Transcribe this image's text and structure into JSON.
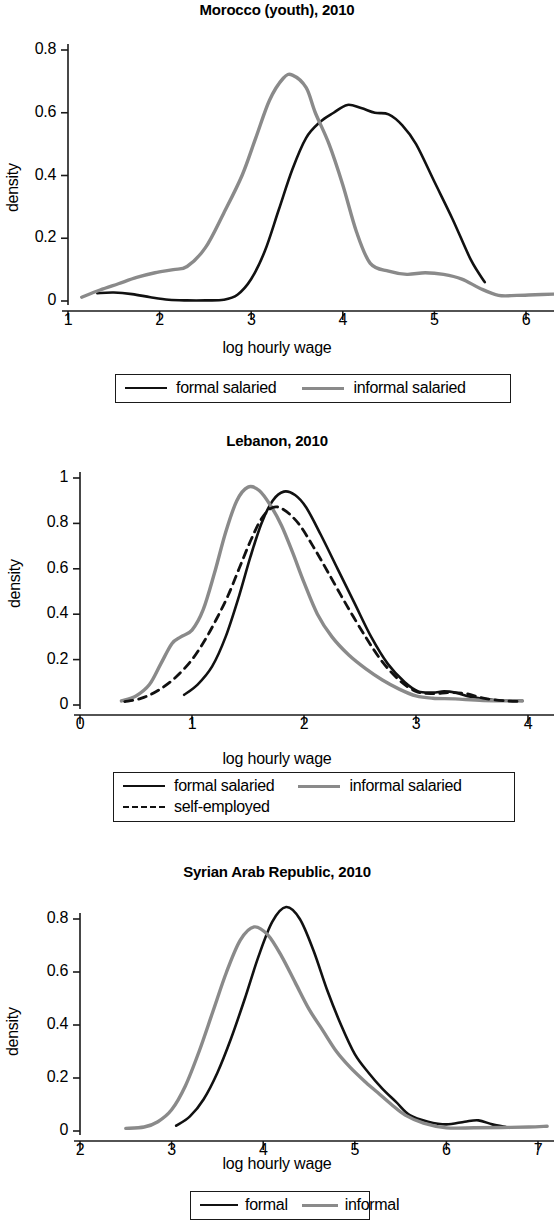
{
  "figure": {
    "axis_label_x": "log hourly wage",
    "axis_label_y": "density"
  },
  "panels": [
    {
      "id": "morocco",
      "title": "Morocco (youth), 2010",
      "xlabel": "log hourly wage",
      "ylabel": "density",
      "xticks": [
        "1",
        "2",
        "3",
        "4",
        "5",
        "6"
      ],
      "yticks": [
        "0",
        "0.2",
        "0.4",
        "0.6",
        "0.8"
      ],
      "legend": [
        {
          "label": "formal salaried",
          "style": "solid-black"
        },
        {
          "label": "informal salaried",
          "style": "solid-gray"
        }
      ]
    },
    {
      "id": "lebanon",
      "title": "Lebanon, 2010",
      "xlabel": "log hourly wage",
      "ylabel": "density",
      "xticks": [
        "0",
        "1",
        "2",
        "3",
        "4"
      ],
      "yticks": [
        "0",
        "0.2",
        "0.4",
        "0.6",
        "0.8",
        "1"
      ],
      "legend": [
        {
          "label": "formal salaried",
          "style": "solid-black"
        },
        {
          "label": "informal salaried",
          "style": "solid-gray"
        },
        {
          "label": "self-employed",
          "style": "dashed-black"
        }
      ]
    },
    {
      "id": "syria",
      "title": "Syrian Arab Republic, 2010",
      "xlabel": "log hourly wage",
      "ylabel": "density",
      "xticks": [
        "2",
        "3",
        "4",
        "5",
        "6",
        "7"
      ],
      "yticks": [
        "0",
        "0.2",
        "0.4",
        "0.6",
        "0.8"
      ],
      "legend": [
        {
          "label": "formal",
          "style": "solid-black"
        },
        {
          "label": "informal",
          "style": "solid-gray"
        }
      ]
    }
  ],
  "colors": {
    "formal": "#111111",
    "informal": "#8a8a8a",
    "self_employed": "#111111",
    "axis": "#1a1a1a",
    "background": "#ffffff"
  },
  "chart_data": [
    {
      "type": "line",
      "title": "Morocco (youth), 2010",
      "xlabel": "log hourly wage",
      "ylabel": "density",
      "xlim": [
        1.0,
        6.35
      ],
      "ylim": [
        0,
        0.8
      ],
      "xticks": [
        1,
        2,
        3,
        4,
        5,
        6
      ],
      "yticks": [
        0,
        0.2,
        0.4,
        0.6,
        0.8
      ],
      "grid": false,
      "legend_position": "below-axis",
      "series": [
        {
          "name": "formal salaried",
          "color": "#111111",
          "dash": "solid",
          "x": [
            1.32,
            1.5,
            1.7,
            1.9,
            2.1,
            2.3,
            2.5,
            2.7,
            2.85,
            3.0,
            3.15,
            3.3,
            3.45,
            3.6,
            3.75,
            3.9,
            4.05,
            4.2,
            4.35,
            4.5,
            4.65,
            4.8,
            5.0,
            5.2,
            5.4,
            5.55
          ],
          "y": [
            0.025,
            0.027,
            0.022,
            0.012,
            0.004,
            0.002,
            0.002,
            0.004,
            0.02,
            0.07,
            0.16,
            0.29,
            0.42,
            0.52,
            0.57,
            0.6,
            0.625,
            0.615,
            0.6,
            0.595,
            0.56,
            0.5,
            0.38,
            0.26,
            0.13,
            0.06
          ]
        },
        {
          "name": "informal salaried",
          "color": "#8a8a8a",
          "dash": "solid",
          "x": [
            1.15,
            1.35,
            1.55,
            1.75,
            1.95,
            2.15,
            2.3,
            2.5,
            2.7,
            2.9,
            3.05,
            3.2,
            3.35,
            3.45,
            3.6,
            3.7,
            3.85,
            4.0,
            4.15,
            4.3,
            4.5,
            4.7,
            4.9,
            5.1,
            5.3,
            5.5,
            5.7,
            5.9,
            6.1,
            6.3
          ],
          "y": [
            0.012,
            0.035,
            0.055,
            0.075,
            0.09,
            0.1,
            0.11,
            0.17,
            0.28,
            0.4,
            0.52,
            0.64,
            0.71,
            0.72,
            0.68,
            0.6,
            0.5,
            0.37,
            0.22,
            0.12,
            0.095,
            0.085,
            0.09,
            0.085,
            0.07,
            0.04,
            0.018,
            0.018,
            0.02,
            0.022
          ]
        }
      ]
    },
    {
      "type": "line",
      "title": "Lebanon, 2010",
      "xlabel": "log hourly wage",
      "ylabel": "density",
      "xlim": [
        0.0,
        4.0
      ],
      "ylim": [
        0,
        1.0
      ],
      "xticks": [
        0,
        1,
        2,
        3,
        4
      ],
      "yticks": [
        0,
        0.2,
        0.4,
        0.6,
        0.8,
        1
      ],
      "grid": false,
      "legend_position": "below-axis",
      "series": [
        {
          "name": "formal salaried",
          "color": "#111111",
          "dash": "solid",
          "x": [
            0.93,
            1.05,
            1.18,
            1.3,
            1.42,
            1.52,
            1.62,
            1.72,
            1.82,
            1.92,
            2.02,
            2.15,
            2.3,
            2.45,
            2.6,
            2.75,
            2.9,
            3.02,
            3.15,
            3.25,
            3.35,
            3.5,
            3.7,
            3.95
          ],
          "y": [
            0.045,
            0.09,
            0.17,
            0.3,
            0.48,
            0.65,
            0.8,
            0.9,
            0.94,
            0.925,
            0.87,
            0.75,
            0.6,
            0.45,
            0.3,
            0.18,
            0.1,
            0.06,
            0.055,
            0.06,
            0.055,
            0.035,
            0.022,
            0.018
          ]
        },
        {
          "name": "informal salaried",
          "color": "#8a8a8a",
          "dash": "solid",
          "x": [
            0.37,
            0.5,
            0.62,
            0.72,
            0.82,
            0.9,
            1.0,
            1.1,
            1.2,
            1.3,
            1.4,
            1.5,
            1.6,
            1.7,
            1.8,
            1.9,
            2.0,
            2.12,
            2.25,
            2.4,
            2.55,
            2.7,
            2.85,
            3.0,
            3.15,
            3.35,
            3.6,
            3.95
          ],
          "y": [
            0.018,
            0.04,
            0.09,
            0.18,
            0.27,
            0.3,
            0.33,
            0.42,
            0.58,
            0.76,
            0.9,
            0.96,
            0.945,
            0.88,
            0.79,
            0.67,
            0.54,
            0.4,
            0.3,
            0.22,
            0.16,
            0.11,
            0.07,
            0.04,
            0.03,
            0.027,
            0.02,
            0.018
          ]
        },
        {
          "name": "self-employed",
          "color": "#111111",
          "dash": "dashed",
          "x": [
            0.4,
            0.55,
            0.7,
            0.85,
            1.0,
            1.12,
            1.22,
            1.32,
            1.42,
            1.52,
            1.62,
            1.72,
            1.82,
            1.95,
            2.08,
            2.22,
            2.38,
            2.55,
            2.7,
            2.85,
            3.0,
            3.15,
            3.3,
            3.45,
            3.6,
            3.8,
            3.95
          ],
          "y": [
            0.015,
            0.03,
            0.065,
            0.12,
            0.2,
            0.29,
            0.38,
            0.48,
            0.6,
            0.72,
            0.82,
            0.87,
            0.86,
            0.8,
            0.7,
            0.58,
            0.44,
            0.3,
            0.19,
            0.11,
            0.06,
            0.05,
            0.055,
            0.05,
            0.03,
            0.018,
            0.015
          ]
        }
      ]
    },
    {
      "type": "line",
      "title": "Syrian Arab Republic, 2010",
      "xlabel": "log hourly wage",
      "ylabel": "density",
      "xlim": [
        2.0,
        7.15
      ],
      "ylim": [
        0,
        0.85
      ],
      "xticks": [
        2,
        3,
        4,
        5,
        6,
        7
      ],
      "yticks": [
        0,
        0.2,
        0.4,
        0.6,
        0.8
      ],
      "grid": false,
      "legend_position": "below-axis",
      "series": [
        {
          "name": "formal",
          "color": "#111111",
          "dash": "solid",
          "x": [
            3.05,
            3.2,
            3.35,
            3.5,
            3.65,
            3.8,
            3.95,
            4.1,
            4.25,
            4.4,
            4.55,
            4.7,
            4.85,
            5.0,
            5.15,
            5.3,
            5.45,
            5.6,
            5.8,
            6.0,
            6.2,
            6.35,
            6.5,
            6.65
          ],
          "y": [
            0.02,
            0.055,
            0.12,
            0.22,
            0.35,
            0.5,
            0.66,
            0.79,
            0.845,
            0.8,
            0.68,
            0.53,
            0.4,
            0.29,
            0.22,
            0.16,
            0.11,
            0.06,
            0.035,
            0.025,
            0.035,
            0.04,
            0.025,
            0.015
          ]
        },
        {
          "name": "informal",
          "color": "#8a8a8a",
          "dash": "solid",
          "x": [
            2.5,
            2.7,
            2.85,
            3.0,
            3.15,
            3.3,
            3.45,
            3.6,
            3.75,
            3.9,
            4.05,
            4.2,
            4.35,
            4.5,
            4.65,
            4.8,
            4.95,
            5.1,
            5.25,
            5.4,
            5.55,
            5.75,
            6.0,
            6.3,
            6.6,
            6.9,
            7.1
          ],
          "y": [
            0.01,
            0.015,
            0.035,
            0.08,
            0.17,
            0.3,
            0.45,
            0.6,
            0.72,
            0.77,
            0.74,
            0.66,
            0.56,
            0.46,
            0.38,
            0.3,
            0.24,
            0.19,
            0.145,
            0.1,
            0.06,
            0.03,
            0.012,
            0.012,
            0.013,
            0.015,
            0.018
          ]
        }
      ]
    }
  ]
}
